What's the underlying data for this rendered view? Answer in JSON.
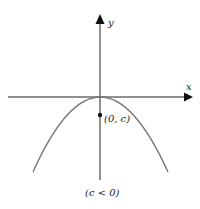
{
  "diagram": {
    "type": "parabola-graph",
    "axes": {
      "x_label": "x",
      "y_label": "y"
    },
    "point": {
      "label": "(0, c)"
    },
    "caption": "(c < 0)",
    "colors": {
      "axes": "#222222",
      "curve": "#777777",
      "point": "#111111",
      "background": "#ffffff"
    }
  }
}
